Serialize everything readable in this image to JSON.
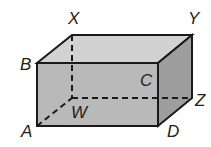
{
  "diagram": {
    "type": "rectangular-prism",
    "colors": {
      "front": "#b8b8b8",
      "top": "#d0d0d0",
      "side": "#9c9c9c",
      "edge": "#1a1a1a"
    },
    "vertices": {
      "A": {
        "label": "A",
        "x": 37,
        "y": 126
      },
      "B": {
        "label": "B",
        "x": 37,
        "y": 63
      },
      "C": {
        "label": "C",
        "x": 158,
        "y": 63
      },
      "D": {
        "label": "D",
        "x": 158,
        "y": 126
      },
      "W": {
        "label": "W",
        "x": 72,
        "y": 98
      },
      "X": {
        "label": "X",
        "x": 72,
        "y": 35
      },
      "Y": {
        "label": "Y",
        "x": 192,
        "y": 35
      },
      "Z": {
        "label": "Z",
        "x": 192,
        "y": 98
      }
    },
    "hidden_edges": [
      "XW",
      "WZ",
      "AW"
    ]
  }
}
